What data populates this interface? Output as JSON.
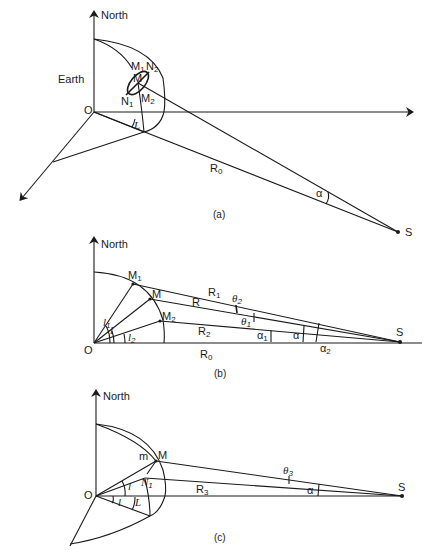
{
  "panels": {
    "a": {
      "caption": "(a)",
      "labels": {
        "north": "North",
        "earth": "Earth",
        "origin": "O",
        "m": "M",
        "m1": "M",
        "m1_sub": "1",
        "m2": "M",
        "m2_sub": "2",
        "n1": "N",
        "n1_sub": "1",
        "n2": "N",
        "n2_sub": "2",
        "latitude": "L",
        "r0": "R",
        "r0_sub": "0",
        "alpha": "α",
        "source": "S"
      }
    },
    "b": {
      "caption": "(b)",
      "labels": {
        "north": "North",
        "origin": "O",
        "m": "M",
        "m1": "M",
        "m1_sub": "1",
        "m2": "M",
        "m2_sub": "2",
        "r": "R",
        "r1": "R",
        "r1_sub": "1",
        "r2": "R",
        "r2_sub": "2",
        "r0": "R",
        "r0_sub": "0",
        "l": "l",
        "l1": "l",
        "l1_sub": "1",
        "l2": "l",
        "l2_sub": "2",
        "theta1": "θ",
        "theta1_sub": "1",
        "theta2": "θ",
        "theta2_sub": "2",
        "alpha": "α",
        "alpha1": "α",
        "alpha1_sub": "1",
        "alpha2": "α",
        "alpha2_sub": "2",
        "source": "S"
      }
    },
    "c": {
      "caption": "(c)",
      "labels": {
        "north": "North",
        "origin": "O",
        "m": "M",
        "m_small": "m",
        "n1": "N",
        "n1_sub": "1",
        "l": "l",
        "l_lower": "l",
        "latitude": "L",
        "r3": "R",
        "r3_sub": "3",
        "theta3": "θ",
        "theta3_sub": "3",
        "alpha": "α",
        "source": "S"
      }
    }
  }
}
